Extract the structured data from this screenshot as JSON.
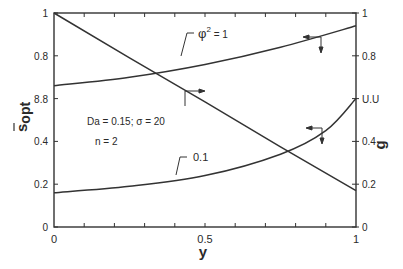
{
  "chart_data": {
    "type": "line",
    "title": "",
    "xlabel": "y",
    "ylabel_left": "s_opt (overbar)",
    "ylabel_right": "g",
    "xlim": [
      0,
      1
    ],
    "ylim_left": [
      0,
      1
    ],
    "ylim_right": [
      0,
      1
    ],
    "grid": false,
    "x_tick_labels": [
      "0",
      "0.5",
      "1"
    ],
    "x_minor_ticks": [
      0.1,
      0.2,
      0.3,
      0.4,
      0.6,
      0.7,
      0.8,
      0.9
    ],
    "y_left_tick_labels": [
      "0",
      "0.2",
      "0.4",
      "8.8",
      "0.8",
      "1"
    ],
    "y_left_tick_values": [
      0,
      0.2,
      0.4,
      0.6,
      0.8,
      1
    ],
    "y_right_tick_labels": [
      "0",
      "0.2",
      "0.4",
      "U.U",
      "0.8",
      "1"
    ],
    "y_right_tick_values": [
      0,
      0.2,
      0.4,
      0.6,
      0.8,
      1
    ],
    "annotations": {
      "params_line1": "Da = 0.15; σ = 20",
      "params_line2": "n = 2",
      "curve_label_phi1_symbol": "φ",
      "curve_label_phi1_exp": "2",
      "curve_label_phi1_value": " = 1",
      "curve_label_phi01": "0.1"
    },
    "series": [
      {
        "name": "g (right axis)",
        "axis": "right",
        "x": [
          0,
          0.25,
          0.5,
          0.75,
          1.0
        ],
        "values": [
          1.0,
          0.79,
          0.585,
          0.375,
          0.17
        ]
      },
      {
        "name": "s_opt, φ² = 1",
        "axis": "left",
        "x": [
          0,
          0.25,
          0.5,
          0.75,
          1.0
        ],
        "values": [
          0.66,
          0.7,
          0.76,
          0.84,
          0.94
        ]
      },
      {
        "name": "s_opt, φ² = 0.1",
        "axis": "left",
        "x": [
          0,
          0.25,
          0.5,
          0.75,
          0.9,
          1.0
        ],
        "values": [
          0.16,
          0.19,
          0.24,
          0.34,
          0.45,
          0.6
        ]
      }
    ]
  },
  "labels": {
    "x_axis": "y",
    "y_left_main": "s",
    "y_left_sub": "opt",
    "y_right": "g"
  }
}
